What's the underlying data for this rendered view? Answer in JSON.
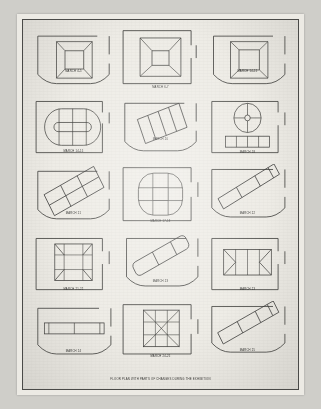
{
  "sheet": {
    "title": "Exhibition floor plan sheet",
    "paper_color": "#eeece6",
    "border_color": "#4a4a48",
    "ink_color": "#3a3a38",
    "background_color": "#cfcec9",
    "caption": "FLOOR PLAN WITH PARTS OF CHANGES DURING THE EXHIBITION",
    "columns": 3,
    "rows": 5
  },
  "cells": [
    {
      "label": "MARCH 4-5",
      "shape": "nested-square-perspective",
      "frame": "curved-bottom"
    },
    {
      "label": "MARCH 6-7",
      "shape": "nested-square-perspective",
      "frame": "straight-bottom"
    },
    {
      "label": "MARCH 14-15",
      "shape": "nested-square-perspective",
      "frame": "curved-bottom"
    },
    {
      "label": "MARCH 14-15",
      "shape": "stadium-divided",
      "frame": "straight-bottom"
    },
    {
      "label": "MARCH 20",
      "shape": "tilted-strip-block",
      "frame": "curved-bottom"
    },
    {
      "label": "MARCH 18",
      "shape": "circle-crosshair-plus-bar",
      "frame": "straight-bottom"
    },
    {
      "label": "MARCH 21",
      "shape": "tilted-grid-block",
      "frame": "curved-bottom"
    },
    {
      "label": "MARCH 17-18",
      "shape": "rounded-square-pinwheel",
      "frame": "straight-bottom"
    },
    {
      "label": "MARCH 22",
      "shape": "diagonal-long-bar",
      "frame": "curved-bottom"
    },
    {
      "label": "MARCH 21-22",
      "shape": "square-diagonal-core",
      "frame": "straight-bottom"
    },
    {
      "label": "MARCH 23",
      "shape": "diagonal-thick-bar",
      "frame": "curved-bottom"
    },
    {
      "label": "MARCH 23",
      "shape": "rect-triangular-ends",
      "frame": "straight-bottom"
    },
    {
      "label": "MARCH 24",
      "shape": "horizontal-long-bar",
      "frame": "curved-bottom"
    },
    {
      "label": "MARCH 24-25",
      "shape": "nine-square-diagonals",
      "frame": "straight-bottom"
    },
    {
      "label": "MARCH 25",
      "shape": "diagonal-long-bar-2",
      "frame": "curved-bottom"
    }
  ]
}
